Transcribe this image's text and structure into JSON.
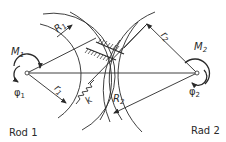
{
  "diagram": {
    "wheel1": {
      "caption": "Rod 1",
      "moment": {
        "symbol": "M",
        "sub": "1"
      },
      "angle": {
        "symbol": "φ",
        "sub": "1"
      },
      "outer_radius": {
        "symbol": "R",
        "sub": "1"
      },
      "inner_radius": {
        "symbol": "r",
        "sub": "1"
      }
    },
    "wheel2": {
      "caption": "Rad 2",
      "moment": {
        "symbol": "M",
        "sub": "2"
      },
      "angle": {
        "symbol": "φ",
        "sub": "2"
      },
      "outer_radius": {
        "symbol": "R",
        "sub": "2"
      },
      "inner_radius": {
        "symbol": "r",
        "sub": "2"
      }
    },
    "spring": {
      "symbol": "k"
    },
    "colors": {
      "line": "#2a2a2a",
      "background": "#ffffff"
    }
  }
}
